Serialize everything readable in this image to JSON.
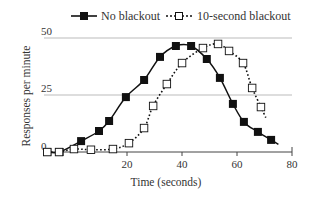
{
  "chart_data": {
    "type": "line",
    "title": "",
    "xlabel": "Time (seconds)",
    "ylabel": "Responses per minute",
    "xlim": [
      -10,
      80
    ],
    "ylim": [
      0,
      50
    ],
    "x_ticks": [
      20,
      40,
      60,
      80
    ],
    "y_ticks": [
      0,
      25,
      50
    ],
    "grid": {
      "horizontal": true,
      "vertical": false,
      "lines_at": [
        25,
        50
      ]
    },
    "legend": {
      "position": "top",
      "entries": [
        "No blackout",
        "10-second blackout"
      ]
    },
    "series": [
      {
        "name": "No blackout",
        "style": "solid-line filled-square",
        "x": [
          -9,
          -4.5,
          3.3,
          9.8,
          13.5,
          19.6,
          26.2,
          32,
          37.8,
          43.3,
          49,
          53.8,
          58.5,
          62.5,
          67.6,
          72.4
        ],
        "y": [
          0,
          0,
          4.8,
          9.2,
          13.6,
          24.1,
          31.6,
          41.7,
          46.5,
          46.5,
          40.8,
          32.5,
          21.1,
          13.2,
          8.8,
          5.3
        ]
      },
      {
        "name": "10-second blackout",
        "style": "dotted-line open-square",
        "x": [
          -9,
          -4.7,
          0.7,
          6.9,
          14.9,
          20.7,
          26.2,
          29.5,
          34.5,
          40,
          47.6,
          53.1,
          57.1,
          62.2,
          65.5,
          68.7
        ],
        "y": [
          0,
          0,
          1.3,
          1,
          1.3,
          3.9,
          10.5,
          20.2,
          29.8,
          39,
          45.6,
          47.4,
          44.3,
          39,
          28.1,
          19.7
        ]
      }
    ]
  },
  "labels": {
    "y_tick_0": "0",
    "y_tick_25": "25",
    "y_tick_50": "50",
    "x_tick_20": "20",
    "x_tick_40": "40",
    "x_tick_60": "60",
    "x_tick_80": "80",
    "xlabel": "Time (seconds)",
    "ylabel": "Responses per minute",
    "legend_no_blackout": "No blackout",
    "legend_blackout": "10-second blackout"
  },
  "colors": {
    "line": "#111111",
    "grid": "#bbbbbb",
    "axis": "#444444",
    "marker_fill": "#111111",
    "open_marker_fill": "#ffffff"
  },
  "layout": {
    "x0_px": 72,
    "px_per_sec": 2.75,
    "y0_px": 152,
    "px_per_unit": 2.28,
    "axis_left_px": 44,
    "axis_right_px": 292
  }
}
